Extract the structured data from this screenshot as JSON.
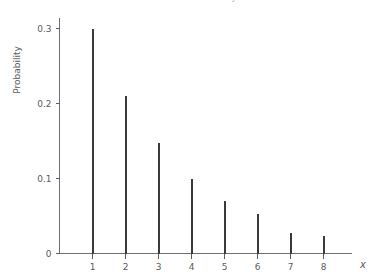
{
  "figure": {
    "clipped_caption_text": "Probability distribution function",
    "background_color": "#ffffff",
    "stem_color": "#3a3a3a",
    "axis_color": "#6e6e73",
    "text_color": "#5a5a5e"
  },
  "chart_data": {
    "type": "bar",
    "title": "",
    "subtitle": "",
    "xlabel": "x",
    "ylabel": "Probability",
    "categories": [
      "1",
      "2",
      "3",
      "4",
      "5",
      "6",
      "7",
      "8"
    ],
    "x": [
      1,
      2,
      3,
      4,
      5,
      6,
      7,
      8
    ],
    "values": [
      0.3,
      0.21,
      0.147,
      0.1,
      0.07,
      0.053,
      0.027,
      0.023
    ],
    "xlim": [
      0,
      8.8
    ],
    "ylim": [
      0,
      0.3
    ],
    "ytick_labels": [
      "0",
      "0.1",
      "0.2",
      "0.3"
    ],
    "ytick_values": [
      0,
      0.1,
      0.2,
      0.3
    ],
    "xtick_labels": [
      "1",
      "2",
      "3",
      "4",
      "5",
      "6",
      "7",
      "8"
    ],
    "xtick_values": [
      1,
      2,
      3,
      4,
      5,
      6,
      7,
      8
    ],
    "grid": false,
    "legend": null,
    "annotations": [],
    "style": "impulse-stem"
  }
}
